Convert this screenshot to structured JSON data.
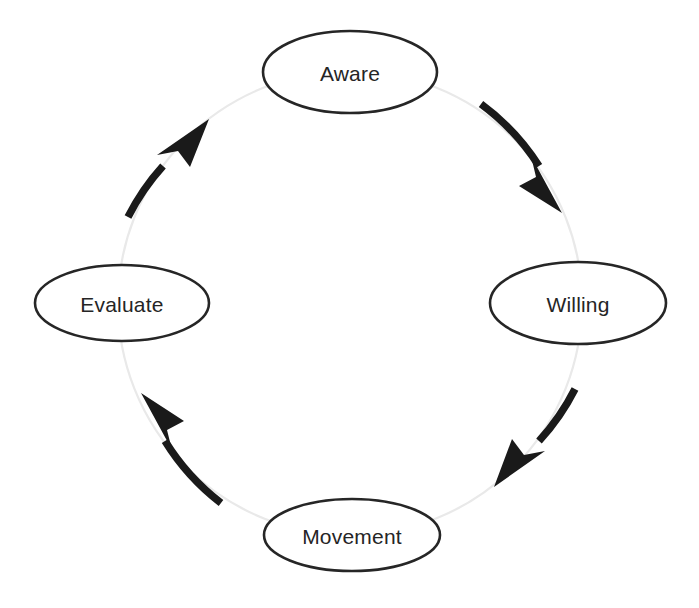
{
  "diagram": {
    "type": "cycle",
    "direction": "clockwise",
    "background_color": "#ffffff",
    "node_stroke_color": "#262626",
    "node_fill_color": "#ffffff",
    "label_color": "#252525",
    "arrow_color": "#1a1a1a",
    "guide_ring_color": "#e9e9e9",
    "nodes": [
      {
        "id": "aware",
        "label": "Aware",
        "position": "top",
        "cx": 350,
        "cy": 72,
        "rx": 87,
        "ry": 41
      },
      {
        "id": "willing",
        "label": "Willing",
        "position": "right",
        "cx": 578,
        "cy": 303,
        "rx": 88,
        "ry": 41
      },
      {
        "id": "movement",
        "label": "Movement",
        "position": "bottom",
        "cx": 352,
        "cy": 535,
        "rx": 88,
        "ry": 36
      },
      {
        "id": "evaluate",
        "label": "Evaluate",
        "position": "left",
        "cx": 122,
        "cy": 303,
        "rx": 87,
        "ry": 38
      }
    ],
    "edges": [
      {
        "id": "aware-to-willing",
        "from": "Aware",
        "to": "Willing",
        "arc": "top-right"
      },
      {
        "id": "willing-to-movement",
        "from": "Willing",
        "to": "Movement",
        "arc": "bottom-right"
      },
      {
        "id": "movement-to-evaluate",
        "from": "Movement",
        "to": "Evaluate",
        "arc": "bottom-left"
      },
      {
        "id": "evaluate-to-aware",
        "from": "Evaluate",
        "to": "Aware",
        "arc": "top-left"
      }
    ]
  }
}
